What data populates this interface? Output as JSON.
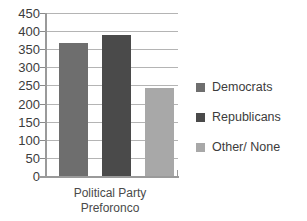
{
  "chart_data": {
    "type": "bar",
    "title": "",
    "subtitle": "",
    "xlabel": "Political Party Preforonco",
    "xlabel_lines": [
      "Political Party",
      "Preforonco"
    ],
    "ylabel": "",
    "categories": [
      "Democrats",
      "Republicans",
      "Other/ None"
    ],
    "values": [
      368,
      390,
      243
    ],
    "series": [
      {
        "name": "Political Party Preference",
        "values": [
          368,
          390,
          243
        ]
      }
    ],
    "ylim": [
      0,
      450
    ],
    "ytick_step": 50,
    "yticks": [
      450,
      400,
      350,
      300,
      250,
      200,
      150,
      100,
      50,
      0
    ],
    "ytick_labels": [
      "450",
      "400",
      "350",
      "300",
      "250",
      "200",
      "150",
      "100",
      "50",
      "0"
    ],
    "grid": true,
    "grid_axis": "y",
    "legend_position": "right",
    "colors": {
      "democrats": "#6e6e6e",
      "republicans": "#4a4a4a",
      "other_none": "#a8a8a8",
      "grid": "#b4b4b4",
      "axis": "#9a9a9a",
      "text": "#3c3c3c",
      "background": "#ffffff"
    },
    "legend": [
      {
        "label": "Democrats",
        "color": "#6e6e6e",
        "swatch": "legend-swatch-democrats"
      },
      {
        "label": "Republicans",
        "color": "#4a4a4a",
        "swatch": "legend-swatch-republicans"
      },
      {
        "label": "Other/ None",
        "color": "#a8a8a8",
        "swatch": "legend-swatch-other-none"
      }
    ]
  }
}
